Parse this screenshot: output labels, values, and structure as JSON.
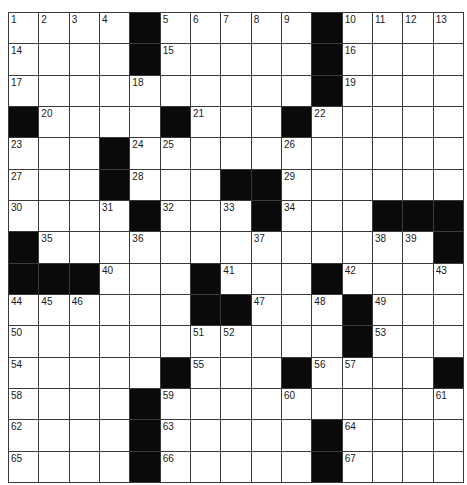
{
  "puzzle": {
    "size": {
      "rows": 15,
      "cols": 15
    },
    "colors": {
      "block": "#0a0a0a",
      "cell": "#ffffff",
      "line": "#3a3a3a",
      "number": "#1a1a1a"
    },
    "grid": [
      [
        "1",
        "2",
        "3",
        "4",
        "#",
        "5",
        "6",
        "7",
        "8",
        "9",
        "#",
        "10",
        "11",
        "12",
        "13"
      ],
      [
        "14",
        "",
        "",
        "",
        "#",
        "15",
        "",
        "",
        "",
        "",
        "#",
        "16",
        "",
        "",
        ""
      ],
      [
        "17",
        "",
        "",
        "",
        "18",
        "",
        "",
        "",
        "",
        "",
        "#",
        "19",
        "",
        "",
        ""
      ],
      [
        "#",
        "20",
        "",
        "",
        "",
        "#",
        "21",
        "",
        "",
        "#",
        "22",
        "",
        "",
        "",
        ""
      ],
      [
        "23",
        "",
        "",
        "#",
        "24",
        "25",
        "",
        "",
        "",
        "26",
        "",
        "",
        "",
        "",
        ""
      ],
      [
        "27",
        "",
        "",
        "#",
        "28",
        "",
        "",
        "#",
        "#",
        "29",
        "",
        "",
        "",
        "",
        ""
      ],
      [
        "30",
        "",
        "",
        "31",
        "#",
        "32",
        "",
        "33",
        "#",
        "34",
        "",
        "",
        "#",
        "#",
        "#"
      ],
      [
        "#",
        "35",
        "",
        "",
        "36",
        "",
        "",
        "",
        "37",
        "",
        "",
        "",
        "38",
        "39",
        "#"
      ],
      [
        "#",
        "#",
        "#",
        "40",
        "",
        "",
        "#",
        "41",
        "",
        "",
        "#",
        "42",
        "",
        "",
        "43"
      ],
      [
        "44",
        "45",
        "46",
        "",
        "",
        "",
        "#",
        "#",
        "47",
        "",
        "48",
        "#",
        "49",
        "",
        ""
      ],
      [
        "50",
        "",
        "",
        "",
        "",
        "",
        "51",
        "52",
        "",
        "",
        "",
        "#",
        "53",
        "",
        ""
      ],
      [
        "54",
        "",
        "",
        "",
        "",
        "#",
        "55",
        "",
        "",
        "#",
        "56",
        "57",
        "",
        "",
        "#"
      ],
      [
        "58",
        "",
        "",
        "",
        "#",
        "59",
        "",
        "",
        "",
        "60",
        "",
        "",
        "",
        "",
        "61"
      ],
      [
        "62",
        "",
        "",
        "",
        "#",
        "63",
        "",
        "",
        "",
        "",
        "#",
        "64",
        "",
        "",
        ""
      ],
      [
        "65",
        "",
        "",
        "",
        "#",
        "66",
        "",
        "",
        "",
        "",
        "#",
        "67",
        "",
        "",
        ""
      ]
    ]
  }
}
